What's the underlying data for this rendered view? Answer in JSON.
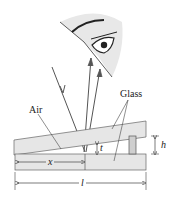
{
  "diagram": {
    "labels": {
      "air": "Air",
      "glass": "Glass",
      "thickness": "t",
      "height": "h",
      "position": "x",
      "length": "l"
    },
    "elements": [
      "eye",
      "incident-ray",
      "reflected-ray-top",
      "reflected-ray-bottom",
      "top-glass-plate",
      "bottom-glass-plate",
      "spacer"
    ],
    "colors": {
      "glass_fill": "#e6e6e6",
      "line": "#444444",
      "eye_fill": "#e8e8e8"
    }
  }
}
